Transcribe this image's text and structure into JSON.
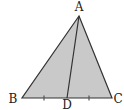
{
  "diagram": {
    "type": "triangle-with-median",
    "colors": {
      "fill": "#c9c9c9",
      "stroke": "#333333",
      "tick": "#555555",
      "text": "#222222"
    },
    "points": {
      "A": {
        "label": "A",
        "x": 79,
        "y": 16,
        "lx": 79,
        "ly": 11
      },
      "B": {
        "label": "B",
        "x": 22,
        "y": 98,
        "lx": 13,
        "ly": 103
      },
      "C": {
        "label": "C",
        "x": 112,
        "y": 98,
        "lx": 118,
        "ly": 103
      },
      "D": {
        "label": "D",
        "x": 67,
        "y": 98,
        "lx": 67,
        "ly": 110
      }
    },
    "segments": [
      "AB",
      "AC",
      "BC",
      "AD"
    ],
    "equal_marks": [
      {
        "segment": "BD",
        "x": 44,
        "y": 98
      },
      {
        "segment": "DC",
        "x": 89,
        "y": 98
      }
    ]
  }
}
